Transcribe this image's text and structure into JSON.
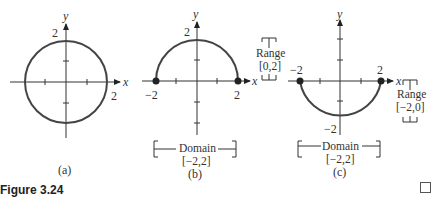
{
  "figure": {
    "caption": "Figure 3.24",
    "end_mark": "□",
    "panels": [
      {
        "id": "a",
        "label": "(a)",
        "axis_x": "x",
        "axis_y": "y",
        "tick_y": "2",
        "tick_x": "2",
        "description": "Full circle x^2 + y^2 = 4"
      },
      {
        "id": "b",
        "label": "(b)",
        "axis_x": "x",
        "axis_y": "y",
        "tick_y": "2",
        "tick_x_left": "−2",
        "tick_x_right": "2",
        "domain_label": "Domain",
        "domain_value": "[−2,2]",
        "range_label": "Range",
        "range_value": "[0,2]",
        "description": "Upper semicircle"
      },
      {
        "id": "c",
        "label": "(c)",
        "axis_x": "x",
        "axis_y": "y",
        "tick_y": "−2",
        "tick_x_left": "−2",
        "tick_x_right": "2",
        "domain_label": "Domain",
        "domain_value": "[−2,2]",
        "range_label": "Range",
        "range_value": "[−2,0]",
        "description": "Lower semicircle"
      }
    ]
  }
}
